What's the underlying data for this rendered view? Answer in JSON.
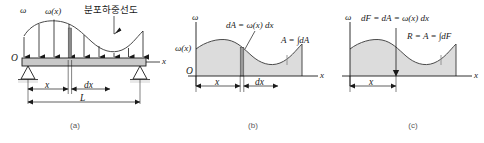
{
  "figure": {
    "title_text": "분포하중선도",
    "panels": [
      {
        "id": "a",
        "caption": "(a)",
        "labels": {
          "omega": "ω",
          "omega_of_x": "ω(x)",
          "origin": "O",
          "axis_x": "x",
          "dim_x": "x",
          "dim_dx": "dx",
          "dim_L": "L",
          "callout": "분포하중선도"
        }
      },
      {
        "id": "b",
        "caption": "(b)",
        "labels": {
          "omega": "ω",
          "omega_of_x": "ω(x)",
          "origin": "O",
          "axis_x": "x",
          "dim_x": "x",
          "dim_dx": "dx",
          "dA_expr": "dA = ω(x) dx",
          "A_expr": "A = ∫dA"
        }
      },
      {
        "id": "c",
        "caption": "(c)",
        "labels": {
          "omega": "ω",
          "axis_x": "x",
          "dim_x": "x",
          "dF_expr": "dF = dA = ω(x) dx",
          "R_expr": "R = A = ∫dF"
        }
      }
    ],
    "colors": {
      "line": "#1a1a1a",
      "curve": "#4a4a4a",
      "fill": "#dcdcdc",
      "beam_fill": "#c9c9c9",
      "strip_fill": "#8a8a8a",
      "caption": "#5a5a5a",
      "ground": "#e8e8e8",
      "background": "#ffffff"
    }
  }
}
